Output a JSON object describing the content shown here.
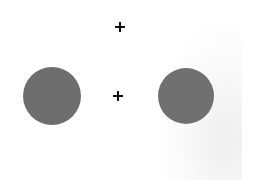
{
  "stimulus": {
    "background": "#ffffff",
    "discs": [
      {
        "name": "left-disc",
        "cx": 52,
        "cy": 96,
        "r": 29,
        "color": "#6e6e6e"
      },
      {
        "name": "right-disc",
        "cx": 186,
        "cy": 96,
        "r": 28,
        "color": "#707070"
      }
    ],
    "crosses": [
      {
        "name": "upper-fixation-cross",
        "cx": 120,
        "cy": 27,
        "glyph": "+",
        "color": "#111111"
      },
      {
        "name": "center-fixation-cross",
        "cx": 118,
        "cy": 96,
        "glyph": "+",
        "color": "#111111"
      }
    ]
  }
}
